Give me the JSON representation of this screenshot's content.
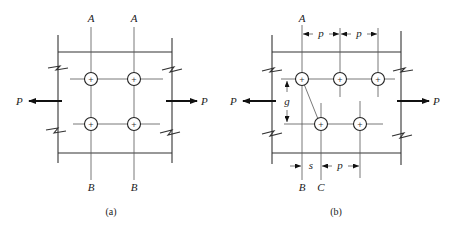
{
  "figures": [
    {
      "id": "a",
      "caption": "(a)",
      "load_label_left": "P",
      "load_label_right": "P",
      "section_top_labels": [
        "A",
        "A"
      ],
      "section_bottom_labels": [
        "B",
        "B"
      ],
      "bolt_pattern": "2 rows x 2 columns, in-line"
    },
    {
      "id": "b",
      "caption": "(b)",
      "load_label_left": "P",
      "load_label_right": "P",
      "section_top_labels": [
        "A"
      ],
      "section_bottom_labels": [
        "B",
        "C"
      ],
      "dimension_labels": {
        "pitch_top_1": "p",
        "pitch_top_2": "p",
        "gage": "g",
        "stagger": "s",
        "pitch_bottom": "p"
      },
      "bolt_pattern": "staggered: 3 top row, 2 bottom row"
    }
  ]
}
